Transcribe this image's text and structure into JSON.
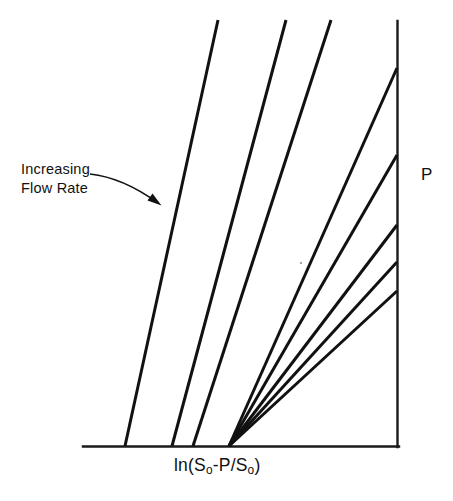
{
  "figure": {
    "background_color": "#ffffff",
    "line_color": "#111111",
    "axis_color": "#1a1a1a",
    "width": 453,
    "height": 501
  },
  "annotation": {
    "line1": "Increasing",
    "line2": "Flow Rate",
    "arrow_name": "increasing-flow-rate-arrow"
  },
  "axis_labels": {
    "x_prefix": "ln(S",
    "x_sub1": "o",
    "x_mid": "-P/S",
    "x_sub2": "o",
    "x_suffix": ")",
    "x_full": "ln(So-P/So)",
    "y": "P"
  },
  "chart_data": {
    "type": "line",
    "title": "",
    "xlabel": "ln(So-P/So)",
    "ylabel": "P",
    "grid": false,
    "legend": null,
    "axes_style": "two-sided: bottom x-axis and right vertical y-axis",
    "xlim": [
      0,
      1
    ],
    "ylim": [
      0,
      1
    ],
    "annotations": [
      {
        "text": "Increasing Flow Rate",
        "arrow_from": [
          0.28,
          0.64
        ],
        "arrow_to": [
          0.43,
          0.55
        ]
      }
    ],
    "series": [
      {
        "name": "line-1",
        "slope_desc": "steepest",
        "x0_px": 125,
        "y0_px": 446,
        "x1_px": 218,
        "y1_px": 20
      },
      {
        "name": "line-2",
        "slope_desc": "very steep",
        "x0_px": 172,
        "y0_px": 446,
        "x1_px": 286,
        "y1_px": 20
      },
      {
        "name": "line-3",
        "slope_desc": "steep",
        "x0_px": 193,
        "y0_px": 446,
        "x1_px": 331,
        "y1_px": 20
      },
      {
        "name": "line-4",
        "slope_desc": "fan-1",
        "x0_px": 229,
        "y0_px": 446,
        "x1_px": 397,
        "y1_px": 68
      },
      {
        "name": "line-5",
        "slope_desc": "fan-2",
        "x0_px": 229,
        "y0_px": 446,
        "x1_px": 397,
        "y1_px": 155
      },
      {
        "name": "line-6",
        "slope_desc": "fan-3",
        "x0_px": 229,
        "y0_px": 446,
        "x1_px": 397,
        "y1_px": 225
      },
      {
        "name": "line-7",
        "slope_desc": "fan-4",
        "x0_px": 229,
        "y0_px": 446,
        "x1_px": 397,
        "y1_px": 262
      },
      {
        "name": "line-8",
        "slope_desc": "shallowest",
        "x0_px": 229,
        "y0_px": 446,
        "x1_px": 397,
        "y1_px": 291
      }
    ],
    "axis_geometry": {
      "x_axis": {
        "x0": 83,
        "y0": 446,
        "x1": 398,
        "y1": 446
      },
      "y_axis": {
        "x0": 398,
        "y0": 22,
        "x1": 398,
        "y1": 446
      }
    }
  }
}
